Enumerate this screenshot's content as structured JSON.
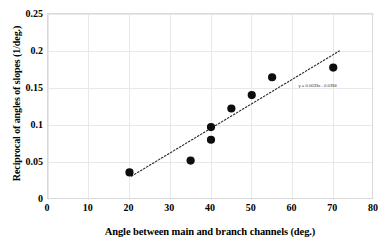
{
  "chart_data": {
    "type": "scatter",
    "title": "",
    "xlabel": "Angle between main and branch channels (deg.)",
    "ylabel": "Reciprocal of angles of slopes (1/deg.)",
    "xlim": [
      0,
      80
    ],
    "ylim": [
      0,
      0.25
    ],
    "xticks": [
      0,
      10,
      20,
      30,
      40,
      50,
      60,
      70,
      80
    ],
    "xticklabels": [
      "0",
      "10",
      "20",
      "30",
      "40",
      "50",
      "60",
      "70",
      "80"
    ],
    "yticks": [
      0,
      0.05,
      0.1,
      0.15,
      0.2,
      0.25
    ],
    "yticklabels": [
      "0",
      "0.05",
      "0.1",
      "0.15",
      "0.2",
      "0.25"
    ],
    "grid": true,
    "legend": "none",
    "marker": "filled-circle",
    "marker_color": "#0d0d0d",
    "points": [
      {
        "x": 20,
        "y": 0.037
      },
      {
        "x": 35,
        "y": 0.053
      },
      {
        "x": 40,
        "y": 0.098
      },
      {
        "x": 40,
        "y": 0.081
      },
      {
        "x": 45,
        "y": 0.123
      },
      {
        "x": 50,
        "y": 0.141
      },
      {
        "x": 55,
        "y": 0.165
      },
      {
        "x": 70,
        "y": 0.178
      }
    ],
    "trendline": {
      "style": "dotted",
      "color": "#2b2b2b",
      "slope": 0.0033,
      "intercept": -0.0356,
      "x_start": 20.5,
      "x_end": 71.5,
      "equation_label": "y = 0.0033x - 0.0356"
    },
    "annotations": [
      {
        "name": "trendline-equation",
        "text": "y = 0.0033x - 0.0356",
        "x": 61.5,
        "y": 0.152
      }
    ]
  }
}
